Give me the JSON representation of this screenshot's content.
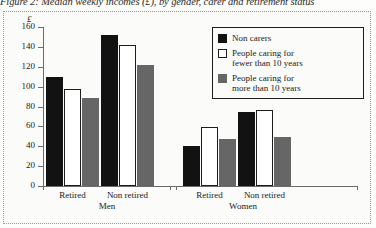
{
  "title": "Figure 2: Median weekly incomes (£), by gender, carer and retirement status",
  "chart_data": {
    "type": "bar",
    "title": "Figure 2: Median weekly incomes (£), by gender, carer and retirement status",
    "xlabel": "",
    "ylabel": "£",
    "ylim": [
      0,
      160
    ],
    "ytick_labels": [
      "0",
      "20",
      "40",
      "60",
      "80",
      "100",
      "120",
      "140",
      "160"
    ],
    "ytick_values": [
      0,
      20,
      40,
      60,
      80,
      100,
      120,
      140,
      160
    ],
    "grid": false,
    "legend_position": "top-right",
    "categories": [
      "Retired",
      "Non retired",
      "Retired",
      "Non retired"
    ],
    "supercategories": [
      "Men",
      "Women"
    ],
    "groups": [
      {
        "supercategory": "Men",
        "category": "Retired",
        "values": [
          110,
          98,
          89
        ]
      },
      {
        "supercategory": "Men",
        "category": "Non retired",
        "values": [
          152,
          142,
          122
        ]
      },
      {
        "supercategory": "Women",
        "category": "Retired",
        "values": [
          40,
          59,
          47
        ]
      },
      {
        "supercategory": "Women",
        "category": "Non retired",
        "values": [
          74,
          76,
          49
        ]
      }
    ],
    "series": [
      {
        "name": "Non carers",
        "color": "#121212",
        "values": [
          110,
          152,
          40,
          74
        ]
      },
      {
        "name": "People caring for fewer than 10 years",
        "color": "#ffffff",
        "values": [
          98,
          142,
          59,
          76
        ]
      },
      {
        "name": "People caring for more than 10 years",
        "color": "#666666",
        "values": [
          89,
          122,
          47,
          49
        ]
      }
    ]
  },
  "legend": {
    "items": [
      {
        "label": "Non carers",
        "line1": "Non carers",
        "line2": ""
      },
      {
        "label": "People caring for fewer than 10 years",
        "line1": "People caring for",
        "line2": "fewer than 10 years"
      },
      {
        "label": "People caring for more than 10 years",
        "line1": "People caring for",
        "line2": "more than 10 years"
      }
    ]
  },
  "axis": {
    "unit": "£"
  }
}
